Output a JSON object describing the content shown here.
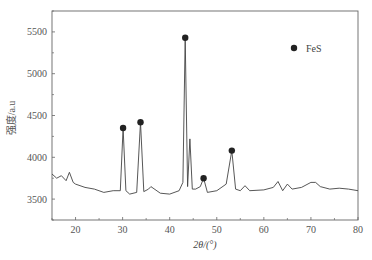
{
  "chart_data": {
    "type": "line",
    "title": "",
    "xlabel": "2θ/(°)",
    "ylabel": "强度/a.u",
    "xlim": [
      15,
      80
    ],
    "ylim": [
      3250,
      5750
    ],
    "xticks": [
      20,
      30,
      40,
      50,
      60,
      70,
      80
    ],
    "yticks": [
      3500,
      4000,
      4500,
      5000,
      5500
    ],
    "legend": [
      {
        "label": "FeS",
        "marker": "filled-circle",
        "position": "top-right"
      }
    ],
    "series": [
      {
        "name": "XRD pattern",
        "x": [
          15,
          16,
          17,
          18,
          18.7,
          19.5,
          20,
          22,
          24,
          26,
          28,
          29.5,
          30.1,
          30.7,
          31.5,
          33,
          33.8,
          34.5,
          35.5,
          36,
          38,
          40,
          42,
          42.8,
          43.3,
          43.8,
          44.3,
          44.8,
          45.5,
          46.5,
          47.2,
          48,
          50,
          52,
          53.2,
          54,
          55,
          56,
          57,
          60,
          62,
          63,
          64,
          65,
          66,
          68,
          70,
          71,
          72,
          74,
          76,
          78,
          80
        ],
        "y": [
          3800,
          3750,
          3780,
          3720,
          3820,
          3700,
          3680,
          3640,
          3620,
          3580,
          3600,
          3600,
          4350,
          3600,
          3560,
          3580,
          4420,
          3590,
          3620,
          3650,
          3570,
          3560,
          3600,
          3700,
          5430,
          3650,
          4220,
          3620,
          3620,
          3650,
          3750,
          3580,
          3600,
          3680,
          4080,
          3620,
          3600,
          3660,
          3600,
          3610,
          3640,
          3710,
          3600,
          3680,
          3620,
          3640,
          3700,
          3700,
          3650,
          3620,
          3630,
          3620,
          3600
        ]
      }
    ],
    "marked_peaks": [
      {
        "x": 30.1,
        "y": 4350,
        "label": "FeS"
      },
      {
        "x": 33.8,
        "y": 4420,
        "label": "FeS"
      },
      {
        "x": 43.3,
        "y": 5430,
        "label": "FeS"
      },
      {
        "x": 47.2,
        "y": 3750,
        "label": "FeS"
      },
      {
        "x": 53.2,
        "y": 4080,
        "label": "FeS"
      }
    ],
    "grid": false
  }
}
